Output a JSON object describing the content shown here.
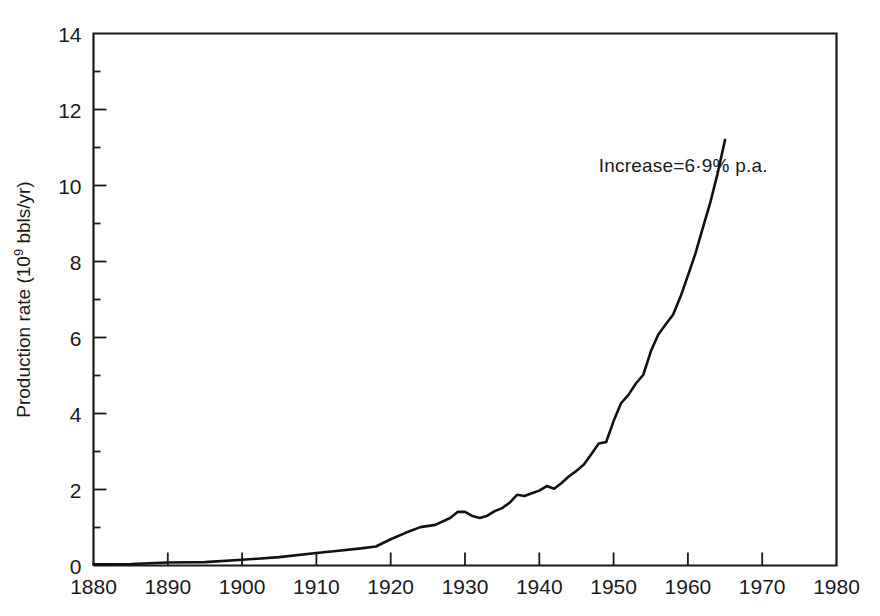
{
  "chart_data": {
    "type": "line",
    "title": "",
    "xlabel": "",
    "ylabel": "Production rate (10⁹ bbls/yr)",
    "ylabel_parts": {
      "prefix": "Production rate (10",
      "superscript": "9",
      "suffix": " bbls/yr)"
    },
    "xlim": [
      1880,
      1980
    ],
    "ylim": [
      0,
      14
    ],
    "xticks": [
      1880,
      1890,
      1900,
      1910,
      1920,
      1930,
      1940,
      1950,
      1960,
      1970,
      1980
    ],
    "yticks": [
      0,
      2,
      4,
      6,
      8,
      10,
      12,
      14
    ],
    "xtick_labels": [
      "1880",
      "1890",
      "1900",
      "1910",
      "1920",
      "1930",
      "1940",
      "1950",
      "1960",
      "1970",
      "1980"
    ],
    "ytick_labels": [
      "0",
      "2",
      "4",
      "6",
      "8",
      "10",
      "12",
      "14"
    ],
    "grid": false,
    "legend": "none",
    "line_color": "#111111",
    "annotations": [
      {
        "name": "growth-rate-annotation",
        "text": "Increase=6·9% p.a.",
        "x": 1948,
        "y": 10.35
      }
    ],
    "series": [
      {
        "name": "World crude oil production rate",
        "x": [
          1880,
          1885,
          1890,
          1895,
          1900,
          1905,
          1910,
          1913,
          1916,
          1918,
          1920,
          1922,
          1924,
          1926,
          1928,
          1929,
          1930,
          1931,
          1932,
          1933,
          1934,
          1935,
          1936,
          1937,
          1938,
          1939,
          1940,
          1941,
          1942,
          1943,
          1944,
          1945,
          1946,
          1947,
          1948,
          1949,
          1950,
          1951,
          1952,
          1953,
          1954,
          1955,
          1956,
          1957,
          1958,
          1959,
          1960,
          1961,
          1962,
          1963,
          1964,
          1965
        ],
        "y": [
          0.03,
          0.04,
          0.08,
          0.09,
          0.15,
          0.22,
          0.33,
          0.39,
          0.45,
          0.5,
          0.69,
          0.86,
          1.01,
          1.07,
          1.25,
          1.41,
          1.41,
          1.3,
          1.25,
          1.31,
          1.43,
          1.51,
          1.65,
          1.86,
          1.83,
          1.9,
          1.97,
          2.09,
          2.02,
          2.17,
          2.35,
          2.49,
          2.66,
          2.93,
          3.21,
          3.25,
          3.8,
          4.27,
          4.49,
          4.79,
          5.02,
          5.63,
          6.07,
          6.34,
          6.6,
          7.07,
          7.63,
          8.2,
          8.88,
          9.54,
          10.32,
          11.2
        ]
      }
    ]
  }
}
